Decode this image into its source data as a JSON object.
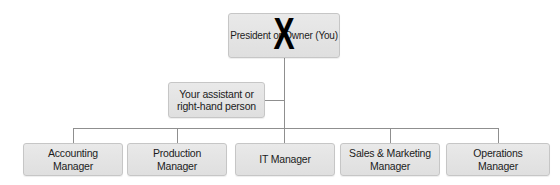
{
  "org_chart": {
    "title": "Organizational chart",
    "root": {
      "label": "President or Owner (You)",
      "crossed_out": true,
      "cross_out_mark": "X"
    },
    "assistant": {
      "label": "Your assistant or right-hand person"
    },
    "managers": [
      {
        "label": "Accounting Manager"
      },
      {
        "label": "Production Manager"
      },
      {
        "label": "IT Manager"
      },
      {
        "label": "Sales & Marketing Manager"
      },
      {
        "label": "Operations Manager"
      }
    ]
  },
  "colors": {
    "background": "#ffffff",
    "node_fill": "#e4e4e4",
    "node_border": "#c6c6c6",
    "connector_line": "#8f8f8f",
    "text": "#1c1c1c",
    "cross_out": "#000000"
  }
}
